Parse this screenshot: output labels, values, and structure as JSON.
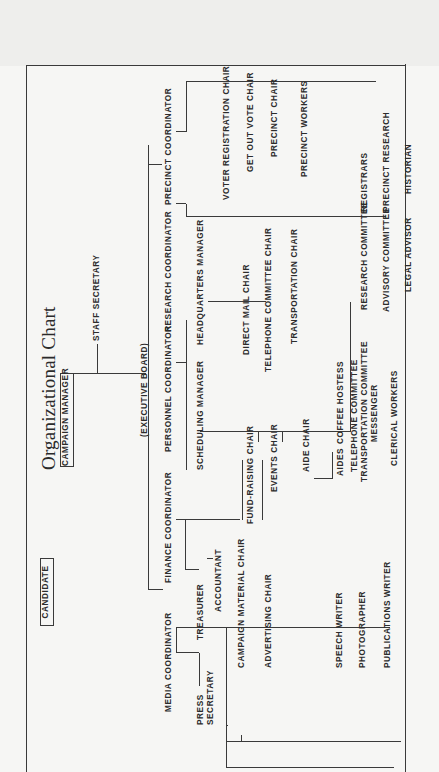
{
  "title": "Organizational Chart",
  "top": {
    "candidate": "CANDIDATE",
    "campaign_manager": "CAMPAIGN MANAGER",
    "staff_secretary": "STAFF SECRETARY",
    "executive_board": "(EXECUTIVE BOARD)"
  },
  "coordinators": [
    {
      "label": "MEDIA COORDINATOR"
    },
    {
      "label": "FINANCE COORDINATOR"
    },
    {
      "label": "PERSONNEL COORDINATOR"
    },
    {
      "label": "RESEARCH COORDINATOR"
    },
    {
      "label": "PRECINCT COORDINATOR"
    }
  ],
  "media": {
    "press_secretary_line1": "PRESS",
    "press_secretary_line2": "SECRETARY",
    "items": [
      "CAMPAIGN MATERIAL CHAIR",
      "ADVERTISING CHAIR",
      "SPEECH WRITER",
      "PHOTOGRAPHER",
      "PUBLICATIONS WRITER"
    ]
  },
  "finance": {
    "treasurer": "TREASURER",
    "accountant": "ACCOUNTANT",
    "fund_raising_chair": "FUND-RAISING CHAIR",
    "events_chair": "EVENTS CHAIR"
  },
  "personnel": {
    "scheduling_manager": "SCHEDULING MANAGER",
    "aide_chair": "AIDE CHAIR",
    "aides": "AIDES",
    "coffee_hostess": "COFFEE HOSTESS",
    "headquarters_manager": "HEADQUARTERS MANAGER",
    "hq_items": [
      "DIRECT MAIL CHAIR",
      "TELEPHONE COMMITTEE CHAIR",
      "TRANSPORTATION CHAIR"
    ],
    "staff_items": [
      "TELEPHONE COMMITTEE",
      "TRANSPORTATION COMMITTEE",
      "MESSENGER",
      "CLERICAL WORKERS"
    ]
  },
  "research": {
    "research_committee": "RESEARCH COMMITTEE",
    "advisory_committee": "ADVISORY COMMITTEE",
    "legal_advisor": "LEGAL ADVISOR",
    "registrars": "REGISTRARS",
    "precinct_research": "PRECINCT RESEARCH",
    "historian": "HISTORIAN"
  },
  "precinct": {
    "voter_registration_chair": "VOTER REGISTRATION CHAIR",
    "get_out_vote_chair": "GET OUT VOTE CHAIR",
    "precinct_chair": "PRECINCT CHAIR",
    "precinct_workers": "PRECINCT WORKERS"
  }
}
